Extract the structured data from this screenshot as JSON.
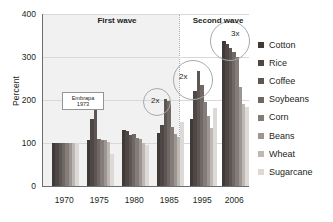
{
  "chart_data": {
    "type": "bar",
    "title": "",
    "xlabel": "",
    "ylabel": "Percent",
    "ylim": [
      0,
      400
    ],
    "yticks": [
      0,
      100,
      200,
      300,
      400
    ],
    "grid": true,
    "legend_position": "right",
    "categories": [
      "1970",
      "1975",
      "1980",
      "1985",
      "1995",
      "2006"
    ],
    "series": [
      {
        "name": "Cotton",
        "color": "#3f3a38",
        "values": [
          100,
          107,
          131,
          123,
          156,
          338
        ]
      },
      {
        "name": "Rice",
        "color": "#4e4745",
        "values": [
          100,
          156,
          127,
          141,
          220,
          330
        ]
      },
      {
        "name": "Coffee",
        "color": "#5d5653",
        "values": [
          100,
          177,
          118,
          203,
          267,
          320
        ]
      },
      {
        "name": "Soybeans",
        "color": "#6f6864",
        "values": [
          100,
          110,
          122,
          197,
          234,
          311
        ]
      },
      {
        "name": "Corn",
        "color": "#847c78",
        "values": [
          100,
          108,
          111,
          138,
          195,
          299
        ]
      },
      {
        "name": "Beans",
        "color": "#9c9590",
        "values": [
          100,
          108,
          109,
          121,
          162,
          230
        ]
      },
      {
        "name": "Wheat",
        "color": "#bdb8b4",
        "values": [
          100,
          102,
          100,
          113,
          134,
          190
        ]
      },
      {
        "name": "Sugarcane",
        "color": "#dcd9d6",
        "values": [
          100,
          74,
          95,
          149,
          181,
          184
        ]
      }
    ],
    "annotations": [
      {
        "name": "first-wave-label",
        "text": "First wave"
      },
      {
        "name": "second-wave-label",
        "text": "Second wave"
      },
      {
        "name": "embrapa-note",
        "line1": "Embrapa",
        "line2": "1973"
      },
      {
        "name": "callout-1985",
        "text": "2x"
      },
      {
        "name": "callout-1995",
        "text": "2x"
      },
      {
        "name": "callout-2006",
        "text": "3x"
      }
    ]
  }
}
